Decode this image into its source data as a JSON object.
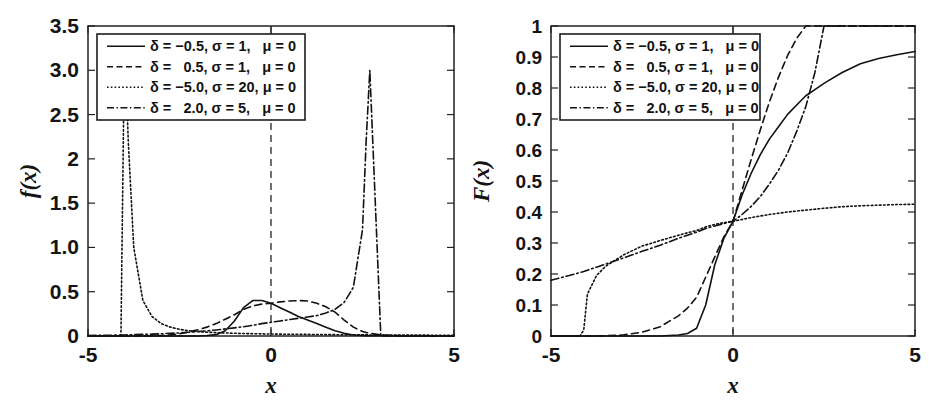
{
  "figure": {
    "width": 932,
    "height": 408,
    "background": "#ffffff",
    "line_color": "#111111",
    "axis_color": "#202020"
  },
  "panels": [
    {
      "id": "pdf-panel",
      "name": "probability-density-plot",
      "ylabel": "f(x)",
      "xlabel": "x",
      "xticks": [
        "-5",
        "0",
        "5"
      ],
      "xtick_values": [
        -5,
        0,
        5
      ],
      "yticks": [
        "0",
        "0.5",
        "1.0",
        "1.5",
        "2",
        "2.5",
        "3.0",
        "3.5"
      ],
      "ytick_values": [
        0,
        0.5,
        1.0,
        1.5,
        2.0,
        2.5,
        3.0,
        3.5
      ],
      "xlim": [
        -5,
        5
      ],
      "ylim": [
        0,
        3.5
      ],
      "vertical_reference_line_x": 0
    },
    {
      "id": "cdf-panel",
      "name": "cumulative-distribution-plot",
      "ylabel": "F(x)",
      "xlabel": "x",
      "xticks": [
        "-5",
        "0",
        "5"
      ],
      "xtick_values": [
        -5,
        0,
        5
      ],
      "yticks": [
        "0",
        "0.1",
        "0.2",
        "0.3",
        "0.4",
        "0.5",
        "0.6",
        "0.7",
        "0.8",
        "0.9",
        "1"
      ],
      "ytick_values": [
        0,
        0.1,
        0.2,
        0.3,
        0.4,
        0.5,
        0.6,
        0.7,
        0.8,
        0.9,
        1.0
      ],
      "xlim": [
        -5,
        5
      ],
      "ylim": [
        0,
        1
      ],
      "vertical_reference_line_x": 0
    }
  ],
  "legend": {
    "entries": [
      {
        "style": "solid",
        "text": "δ = −0.5, σ = 1,   μ = 0",
        "delta": -0.5,
        "sigma": 1,
        "mu": 0
      },
      {
        "style": "dashed",
        "text": "δ =   0.5, σ = 1,   μ = 0",
        "delta": 0.5,
        "sigma": 1,
        "mu": 0
      },
      {
        "style": "dotted",
        "text": "δ = −5.0, σ = 20, μ = 0",
        "delta": -5.0,
        "sigma": 20,
        "mu": 0
      },
      {
        "style": "dashdot",
        "text": "δ =   2.0, σ = 5,   μ = 0",
        "delta": 2.0,
        "sigma": 5,
        "mu": 0
      }
    ]
  },
  "chart_data": [
    {
      "type": "line",
      "title": "",
      "xlabel": "x",
      "ylabel": "f(x)",
      "xlim": [
        -5,
        5
      ],
      "ylim": [
        0,
        3.5
      ],
      "grid": false,
      "legend_position": "top-left",
      "annotations": [
        {
          "kind": "vertical-dashed-line",
          "x": 0
        }
      ],
      "x": [
        -5.0,
        -4.75,
        -4.5,
        -4.25,
        -4.1,
        -4.0,
        -3.9,
        -3.75,
        -3.5,
        -3.25,
        -3.0,
        -2.75,
        -2.5,
        -2.25,
        -2.0,
        -1.75,
        -1.5,
        -1.25,
        -1.0,
        -0.75,
        -0.5,
        -0.25,
        0.0,
        0.25,
        0.5,
        0.75,
        1.0,
        1.25,
        1.5,
        1.75,
        2.0,
        2.25,
        2.5,
        2.6,
        2.7,
        3.0,
        3.5,
        4.0,
        4.5,
        5.0
      ],
      "series": [
        {
          "name": "δ = −0.5, σ = 1, μ = 0",
          "style": "solid",
          "values": [
            0.0,
            0.0,
            0.0,
            0.0,
            0.0,
            0.0,
            0.0,
            0.0,
            0.0,
            0.0,
            0.0,
            0.0,
            0.0,
            0.0,
            0.0,
            0.005,
            0.015,
            0.06,
            0.17,
            0.32,
            0.4,
            0.4,
            0.37,
            0.32,
            0.27,
            0.22,
            0.18,
            0.14,
            0.1,
            0.06,
            0.03,
            0.012,
            0.005,
            0.004,
            0.003,
            0.002,
            0.001,
            0.0,
            0.0,
            0.0
          ]
        },
        {
          "name": "δ =  0.5, σ = 1, μ = 0",
          "style": "dashed",
          "values": [
            0.0,
            0.0,
            0.0,
            0.0,
            0.0,
            0.0,
            0.0,
            0.0,
            0.0,
            0.002,
            0.006,
            0.013,
            0.025,
            0.045,
            0.07,
            0.1,
            0.14,
            0.19,
            0.24,
            0.3,
            0.34,
            0.36,
            0.37,
            0.385,
            0.395,
            0.4,
            0.395,
            0.37,
            0.33,
            0.27,
            0.18,
            0.1,
            0.05,
            0.04,
            0.03,
            0.012,
            0.004,
            0.001,
            0.0,
            0.0
          ]
        },
        {
          "name": "δ = −5.0, σ = 20, μ = 0",
          "style": "dotted",
          "values": [
            0.0,
            0.0,
            0.0,
            0.0,
            0.0,
            3.4,
            2.2,
            1.0,
            0.4,
            0.22,
            0.14,
            0.1,
            0.075,
            0.06,
            0.05,
            0.043,
            0.038,
            0.034,
            0.031,
            0.028,
            0.026,
            0.024,
            0.022,
            0.021,
            0.02,
            0.019,
            0.018,
            0.017,
            0.016,
            0.015,
            0.014,
            0.014,
            0.013,
            0.013,
            0.012,
            0.012,
            0.011,
            0.01,
            0.009,
            0.009
          ]
        },
        {
          "name": "δ =  2.0, σ = 5, μ = 0",
          "style": "dashdot",
          "values": [
            0.006,
            0.007,
            0.008,
            0.01,
            0.011,
            0.012,
            0.013,
            0.015,
            0.018,
            0.021,
            0.025,
            0.03,
            0.035,
            0.042,
            0.05,
            0.058,
            0.068,
            0.08,
            0.092,
            0.105,
            0.12,
            0.14,
            0.155,
            0.17,
            0.185,
            0.2,
            0.215,
            0.23,
            0.26,
            0.3,
            0.38,
            0.55,
            1.2,
            2.2,
            3.0,
            0.0,
            0.0,
            0.0,
            0.0,
            0.0
          ]
        }
      ]
    },
    {
      "type": "line",
      "title": "",
      "xlabel": "x",
      "ylabel": "F(x)",
      "xlim": [
        -5,
        5
      ],
      "ylim": [
        0,
        1
      ],
      "grid": false,
      "legend_position": "top-left",
      "annotations": [
        {
          "kind": "vertical-dashed-line",
          "x": 0
        }
      ],
      "x": [
        -5.0,
        -4.5,
        -4.2,
        -4.1,
        -4.0,
        -3.75,
        -3.5,
        -3.0,
        -2.5,
        -2.0,
        -1.5,
        -1.25,
        -1.0,
        -0.75,
        -0.5,
        -0.25,
        0.0,
        0.25,
        0.5,
        0.75,
        1.0,
        1.25,
        1.5,
        1.75,
        2.0,
        2.25,
        2.5,
        2.6,
        3.0,
        3.5,
        4.0,
        4.5,
        5.0
      ],
      "series": [
        {
          "name": "δ = −0.5, σ = 1, μ = 0",
          "style": "solid",
          "values": [
            0.0,
            0.0,
            0.0,
            0.0,
            0.0,
            0.0,
            0.0,
            0.0,
            0.0,
            0.0,
            0.003,
            0.008,
            0.025,
            0.1,
            0.23,
            0.315,
            0.37,
            0.455,
            0.525,
            0.585,
            0.635,
            0.675,
            0.715,
            0.745,
            0.775,
            0.795,
            0.815,
            0.822,
            0.85,
            0.878,
            0.895,
            0.907,
            0.918
          ]
        },
        {
          "name": "δ =  0.5, σ = 1, μ = 0",
          "style": "dashed",
          "values": [
            0.0,
            0.0,
            0.0,
            0.0,
            0.0,
            0.0,
            0.001,
            0.004,
            0.012,
            0.03,
            0.065,
            0.09,
            0.125,
            0.19,
            0.255,
            0.32,
            0.37,
            0.47,
            0.57,
            0.665,
            0.755,
            0.835,
            0.905,
            0.96,
            1.0,
            1.0,
            1.0,
            1.0,
            1.0,
            1.0,
            1.0,
            1.0,
            1.0
          ]
        },
        {
          "name": "δ = −5.0, σ = 20, μ = 0",
          "style": "dotted",
          "values": [
            0.0,
            0.0,
            0.0,
            0.02,
            0.135,
            0.195,
            0.225,
            0.262,
            0.29,
            0.308,
            0.325,
            0.333,
            0.34,
            0.352,
            0.36,
            0.366,
            0.37,
            0.376,
            0.382,
            0.387,
            0.392,
            0.396,
            0.4,
            0.403,
            0.406,
            0.409,
            0.412,
            0.413,
            0.417,
            0.42,
            0.422,
            0.424,
            0.425
          ]
        },
        {
          "name": "δ =  2.0, σ = 5, μ = 0",
          "style": "dashdot",
          "values": [
            0.18,
            0.195,
            0.205,
            0.208,
            0.212,
            0.222,
            0.232,
            0.252,
            0.273,
            0.293,
            0.315,
            0.325,
            0.335,
            0.347,
            0.355,
            0.363,
            0.37,
            0.392,
            0.418,
            0.45,
            0.49,
            0.535,
            0.59,
            0.66,
            0.74,
            0.85,
            1.0,
            1.0,
            1.0,
            1.0,
            1.0,
            1.0,
            1.0
          ]
        }
      ]
    }
  ]
}
